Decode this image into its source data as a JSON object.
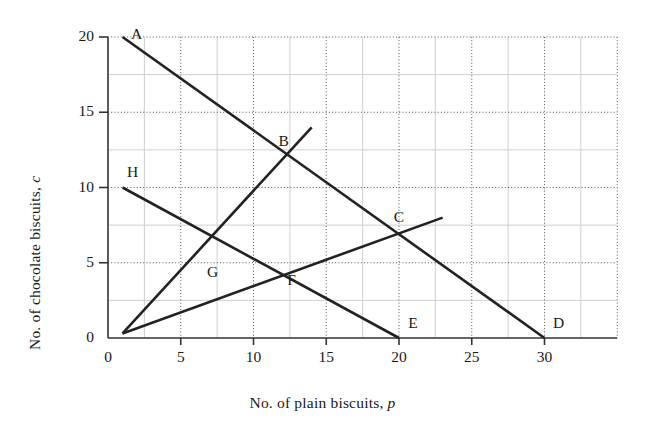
{
  "chart_data": {
    "type": "line",
    "title": "",
    "xlabel": "No. of plain biscuits, p",
    "xlabel_text": "No. of plain biscuits, ",
    "xlabel_var": "p",
    "ylabel": "No. of chocolate biscuits, c",
    "ylabel_text": "No. of chocolate biscuits, ",
    "ylabel_var": "c",
    "xlim": [
      0,
      35
    ],
    "ylim": [
      0,
      20
    ],
    "xticks": [
      0,
      5,
      10,
      15,
      20,
      25,
      30
    ],
    "yticks": [
      0,
      5,
      10,
      15,
      20
    ],
    "xtick_labels": [
      "0",
      "5",
      "10",
      "15",
      "20",
      "25",
      "30"
    ],
    "ytick_labels": [
      "0",
      "5",
      "10",
      "15",
      "20"
    ],
    "grid": {
      "major_style": "dotted",
      "major_color": "#555555",
      "major_step_x": 5,
      "major_step_y": 5,
      "minor_style": "solid",
      "minor_color": "#cfcfcf",
      "minor_step_x": 2.5,
      "minor_step_y": 2.5
    },
    "legend": "none",
    "line_color": "#222222",
    "axis_color": "#333333",
    "series": [
      {
        "name": "AD",
        "points": [
          [
            1,
            20
          ],
          [
            30,
            0
          ]
        ],
        "description": "Line from A (1,20) down to D (30,0)"
      },
      {
        "name": "HE",
        "points": [
          [
            1,
            10
          ],
          [
            20,
            0
          ]
        ],
        "description": "Line from H (1,10) down to E (20,0)"
      },
      {
        "name": "OB",
        "points": [
          [
            1,
            0.3
          ],
          [
            14,
            14
          ]
        ],
        "description": "Steep line from origin through B up to (14,14)"
      },
      {
        "name": "OC",
        "points": [
          [
            1,
            0.3
          ],
          [
            23,
            8
          ]
        ],
        "description": "Shallow line from origin through C up to (23,8)"
      }
    ],
    "labelled_points": [
      {
        "label": "A",
        "x": 1,
        "y": 20,
        "dx": 14,
        "dy": -2
      },
      {
        "label": "B",
        "x": 12,
        "y": 12,
        "dx": 1,
        "dy": -15
      },
      {
        "label": "C",
        "x": 20,
        "y": 7,
        "dx": 0,
        "dy": -15
      },
      {
        "label": "D",
        "x": 30,
        "y": 0,
        "dx": 14,
        "dy": -14
      },
      {
        "label": "E",
        "x": 20,
        "y": 0,
        "dx": 14,
        "dy": -14
      },
      {
        "label": "F",
        "x": 12,
        "y": 4.5,
        "dx": 9,
        "dy": 11
      },
      {
        "label": "G",
        "x": 6.5,
        "y": 5,
        "dx": 10,
        "dy": 10
      },
      {
        "label": "H",
        "x": 1,
        "y": 10,
        "dx": 10,
        "dy": -15
      }
    ]
  }
}
